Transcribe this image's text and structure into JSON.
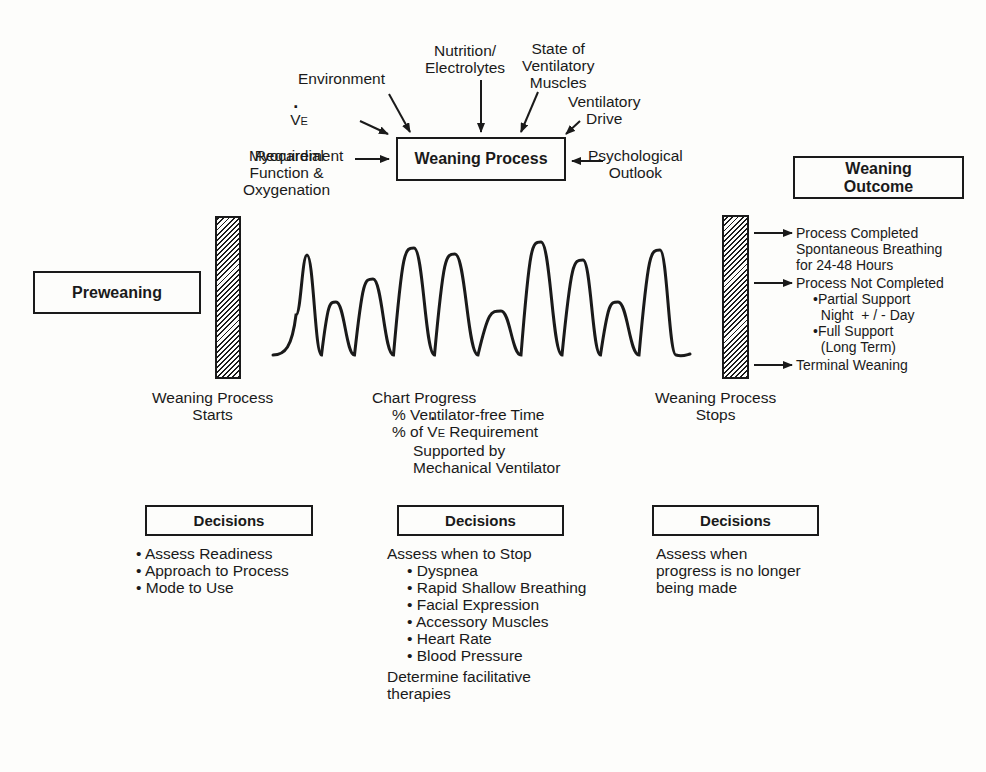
{
  "center_box": {
    "label": "Weaning Process"
  },
  "factors": {
    "nutrition": "Nutrition/\nElectrolytes",
    "state_muscles": "State of\nVentilatory\nMuscles",
    "environment": "Environment",
    "ve_symbol": "V",
    "ve_sub": "E",
    "ve_requirement": "Requirement",
    "ventilatory_drive": "Ventilatory\nDrive",
    "myocardial": "Myocardial\nFunction &\nOxygenation",
    "psychological": "Psychological\nOutlook"
  },
  "preweaning": {
    "label": "Preweaning"
  },
  "outcome": {
    "title": "Weaning\nOutcome",
    "items": [
      "Process Completed\nSpontaneous Breathing\nfor 24-48 Hours",
      "Process Not Completed",
      "Terminal Weaning"
    ],
    "sub_items": [
      "•Partial Support\n  Night  + / - Day",
      "•Full Support\n  (Long Term)"
    ]
  },
  "stages": {
    "starts": "Weaning Process\nStarts",
    "stops": "Weaning Process\nStops",
    "chart_progress": {
      "title": "Chart Progress",
      "line1": "% Ventilator-free Time",
      "line2_prefix": "% of ",
      "line2_symbol": "V",
      "line2_sub": "E",
      "line2_suffix": " Requirement",
      "line3": "Supported by\nMechanical Ventilator"
    }
  },
  "decisions": [
    {
      "title": "Decisions",
      "items": [
        "• Assess Readiness",
        "• Approach to Process",
        "• Mode to Use"
      ]
    },
    {
      "title": "Decisions",
      "intro": "Assess when to Stop",
      "items": [
        "• Dyspnea",
        "• Rapid Shallow Breathing",
        "• Facial Expression",
        "• Accessory Muscles",
        "• Heart Rate",
        "• Blood Pressure"
      ],
      "footer": "Determine facilitative\ntherapies"
    },
    {
      "title": "Decisions",
      "text": "Assess when\nprogress is no longer\nbeing made"
    }
  ],
  "wave": {
    "peaks_x": [
      307,
      336,
      373,
      414,
      455,
      501,
      541,
      583,
      618,
      660
    ],
    "peaks_y": [
      255,
      302,
      279,
      248,
      254,
      311,
      242,
      260,
      302,
      250
    ],
    "baseline_y": 355
  }
}
